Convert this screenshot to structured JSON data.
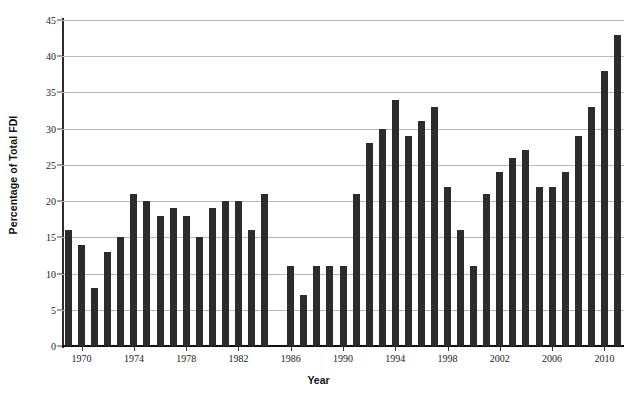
{
  "chart_data": {
    "type": "bar",
    "title": "",
    "xlabel": "Year",
    "ylabel": "Percentage of Total FDI",
    "ylim": [
      0,
      45
    ],
    "ytick_values": [
      0,
      5,
      10,
      15,
      20,
      25,
      30,
      35,
      40,
      45
    ],
    "ytick_labels": [
      "0",
      "5",
      "10",
      "15",
      "20",
      "25",
      "30",
      "35",
      "40",
      "45"
    ],
    "xtick_labels": [
      "1970",
      "1974",
      "1978",
      "1982",
      "1986",
      "1990",
      "1994",
      "1998",
      "2002",
      "2006",
      "2010"
    ],
    "grid": true,
    "legend": "none",
    "bar_color": "#2c2c2c",
    "categories": [
      "1969",
      "1970",
      "1971",
      "1972",
      "1973",
      "1974",
      "1975",
      "1976",
      "1977",
      "1978",
      "1979",
      "1980",
      "1981",
      "1982",
      "1983",
      "1984",
      "1985",
      "1986",
      "1987",
      "1988",
      "1989",
      "1990",
      "1991",
      "1992",
      "1993",
      "1994",
      "1995",
      "1996",
      "1997",
      "1998",
      "1999",
      "2000",
      "2001",
      "2002",
      "2003",
      "2004",
      "2005",
      "2006",
      "2007",
      "2008",
      "2009",
      "2010",
      "2011"
    ],
    "values": [
      16,
      14,
      8,
      13,
      15,
      21,
      20,
      18,
      19,
      18,
      15,
      19,
      20,
      20,
      16,
      21,
      0,
      11,
      7,
      11,
      11,
      11,
      21,
      28,
      30,
      34,
      29,
      31,
      33,
      22,
      16,
      11,
      21,
      24,
      26,
      27,
      22,
      22,
      24,
      29,
      33,
      38,
      43
    ]
  }
}
